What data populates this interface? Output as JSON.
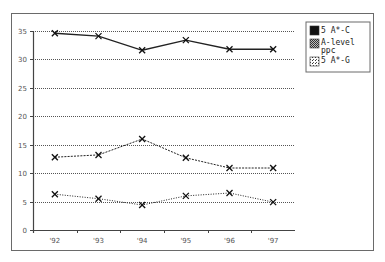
{
  "chart_data": {
    "type": "line",
    "title": "",
    "xlabel": "",
    "ylabel": "",
    "categories": [
      "'92",
      "'93",
      "'94",
      "'95",
      "'96",
      "'97"
    ],
    "series": [
      {
        "name": "5 A*-C",
        "values": [
          34.6,
          34.1,
          31.6,
          33.4,
          31.8,
          31.8
        ],
        "line_style": "solid",
        "swatch": "solid-black"
      },
      {
        "name": "A-level ppc",
        "values": [
          12.8,
          13.2,
          16.0,
          12.7,
          10.9,
          10.9
        ],
        "line_style": "dashed",
        "swatch": "checker-gray"
      },
      {
        "name": "5 A*-G",
        "values": [
          6.3,
          5.5,
          4.4,
          6.0,
          6.5,
          4.9
        ],
        "line_style": "dotted",
        "swatch": "dotted-white"
      }
    ],
    "ylim": [
      0,
      35
    ],
    "yticks": [
      0,
      5,
      10,
      15,
      20,
      25,
      30,
      35
    ],
    "grid": true,
    "grid_style": "dotted-horizontal",
    "legend_position": "top-right",
    "marker": "x"
  },
  "legend": {
    "items": [
      {
        "label_lines": [
          "5 A*-C"
        ]
      },
      {
        "label_lines": [
          "A-level",
          "ppc"
        ]
      },
      {
        "label_lines": [
          "5 A*-G"
        ]
      }
    ]
  },
  "colors": {
    "axis": "#444444",
    "grid": "#555555",
    "line": "#222222",
    "frame": "#6a6a6a"
  }
}
